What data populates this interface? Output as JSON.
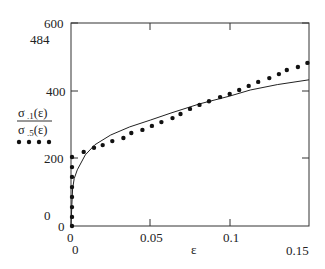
{
  "chart_data": {
    "type": "line",
    "title": "",
    "xlabel": "ε",
    "ylabel": "",
    "xlim": [
      0,
      0.15
    ],
    "ylim": [
      0,
      600
    ],
    "grid": false,
    "x_ticks": [
      "0",
      "0.05",
      "0.1",
      "0.15"
    ],
    "y_ticks": [
      "0",
      "200",
      "400",
      "600"
    ],
    "annotations": [
      "484",
      "0",
      "0",
      "0"
    ],
    "legend": {
      "position": "left-outside",
      "entries": [
        {
          "label_num": "σ .1(ε)",
          "style": "solid line"
        },
        {
          "label_den": "σ .5(ε)",
          "style": "dotted"
        }
      ]
    },
    "series": [
      {
        "name": "σ.1(ε)",
        "style": "solid",
        "x": [
          0,
          0.0005,
          0.001,
          0.002,
          0.004,
          0.009,
          0.015,
          0.025,
          0.037,
          0.05,
          0.063,
          0.081,
          0.1,
          0.113,
          0.13,
          0.15
        ],
        "y": [
          0,
          60,
          110,
          140,
          166,
          210,
          240,
          269,
          293,
          313,
          334,
          361,
          384,
          402,
          418,
          432
        ]
      },
      {
        "name": "σ.5(ε)",
        "style": "dotted",
        "x": [
          0.0006,
          0.0006,
          0.0006,
          0.0006,
          0.0006,
          0.0006,
          0.0006,
          0.0006,
          0.008,
          0.0145,
          0.02,
          0.026,
          0.033,
          0.038,
          0.045,
          0.051,
          0.057,
          0.064,
          0.069,
          0.075,
          0.081,
          0.087,
          0.094,
          0.1,
          0.106,
          0.112,
          0.118,
          0.125,
          0.131,
          0.136,
          0.143,
          0.149
        ],
        "y": [
          0,
          27,
          56,
          86,
          115,
          145,
          174,
          204,
          219,
          231,
          239,
          251,
          260,
          275,
          284,
          296,
          307,
          319,
          331,
          346,
          358,
          369,
          381,
          390,
          402,
          414,
          426,
          437,
          449,
          461,
          470,
          482
        ]
      }
    ]
  },
  "labels": {
    "y_600": "600",
    "y_484": "484",
    "y_400": "400",
    "y_200": "200",
    "y_0a": "0",
    "y_0b": "0",
    "x_0a": "0",
    "x_0b": "0",
    "x_005": "0.05",
    "x_01": "0.1",
    "x_015": "0.15",
    "x_axis": "ε",
    "legend_num": "σ .1(ε)",
    "legend_den": "σ .5(ε)"
  }
}
